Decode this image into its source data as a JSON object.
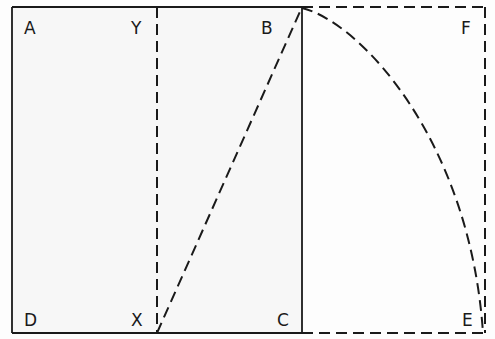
{
  "diagram": {
    "colors": {
      "background": "#fdfdfd",
      "panel": "#f7f7f7",
      "stroke": "#1a1a1a"
    },
    "points": [
      {
        "id": "A",
        "label": "A",
        "x": 12,
        "y": 7,
        "label_x": 24,
        "label_y": 20
      },
      {
        "id": "Y",
        "label": "Y",
        "x": 157,
        "y": 7,
        "label_x": 131,
        "label_y": 20
      },
      {
        "id": "B",
        "label": "B",
        "x": 302,
        "y": 7,
        "label_x": 261,
        "label_y": 20
      },
      {
        "id": "F",
        "label": "F",
        "x": 485,
        "y": 7,
        "label_x": 461,
        "label_y": 20
      },
      {
        "id": "D",
        "label": "D",
        "x": 12,
        "y": 333,
        "label_x": 24,
        "label_y": 312
      },
      {
        "id": "X",
        "label": "X",
        "x": 157,
        "y": 333,
        "label_x": 131,
        "label_y": 312
      },
      {
        "id": "C",
        "label": "C",
        "x": 302,
        "y": 333,
        "label_x": 277,
        "label_y": 312
      },
      {
        "id": "E",
        "label": "E",
        "x": 485,
        "y": 333,
        "label_x": 462,
        "label_y": 312
      }
    ],
    "segments": [
      {
        "name": "edge-AB",
        "from": "A",
        "to": "B",
        "style": "solid"
      },
      {
        "name": "edge-AD",
        "from": "A",
        "to": "D",
        "style": "solid"
      },
      {
        "name": "edge-DC",
        "from": "D",
        "to": "C",
        "style": "solid"
      },
      {
        "name": "edge-BC",
        "from": "B",
        "to": "C",
        "style": "solid"
      },
      {
        "name": "midline-YX",
        "from": "Y",
        "to": "X",
        "style": "dashed"
      },
      {
        "name": "diagonal-XB",
        "from": "X",
        "to": "B",
        "style": "dashed"
      },
      {
        "name": "edge-BF",
        "from": "B",
        "to": "F",
        "style": "dashed"
      },
      {
        "name": "edge-FE",
        "from": "F",
        "to": "E",
        "style": "dashed"
      },
      {
        "name": "edge-CE",
        "from": "C",
        "to": "E",
        "style": "dashed"
      }
    ],
    "arc": {
      "name": "arc-BE",
      "from": "B",
      "to": "E",
      "style": "dashed",
      "path": "M302,8 C360,22 470,140 483,333"
    }
  }
}
